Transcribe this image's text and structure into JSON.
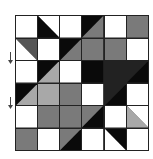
{
  "puzzle": {
    "rows": 6,
    "cols": 6,
    "colors": {
      "W": "#ffffff",
      "K": "#0a0a0a",
      "D": "#222222",
      "G": "#7a7a7a",
      "L": "#a8a8a8",
      "S": "#555555"
    },
    "cells": [
      [
        {
          "type": "solid",
          "a": "W"
        },
        {
          "type": "tr",
          "a": "W",
          "b": "K"
        },
        {
          "type": "solid",
          "a": "W"
        },
        {
          "type": "tl",
          "a": "K",
          "b": "G"
        },
        {
          "type": "solid",
          "a": "W"
        },
        {
          "type": "solid",
          "a": "G"
        }
      ],
      [
        {
          "type": "tr",
          "a": "S",
          "b": "W"
        },
        {
          "type": "solid",
          "a": "W"
        },
        {
          "type": "tl",
          "a": "K",
          "b": "G"
        },
        {
          "type": "solid",
          "a": "G"
        },
        {
          "type": "solid",
          "a": "G"
        },
        {
          "type": "solid",
          "a": "W"
        }
      ],
      [
        {
          "type": "solid",
          "a": "W"
        },
        {
          "type": "tl",
          "a": "K",
          "b": "L"
        },
        {
          "type": "solid",
          "a": "W"
        },
        {
          "type": "solid",
          "a": "K"
        },
        {
          "type": "solid",
          "a": "D"
        },
        {
          "type": "tl",
          "a": "D",
          "b": "K"
        }
      ],
      [
        {
          "type": "tl",
          "a": "K",
          "b": "L"
        },
        {
          "type": "solid",
          "a": "L"
        },
        {
          "type": "solid",
          "a": "G"
        },
        {
          "type": "solid",
          "a": "W"
        },
        {
          "type": "tl",
          "a": "D",
          "b": "K"
        },
        {
          "type": "solid",
          "a": "W"
        }
      ],
      [
        {
          "type": "solid",
          "a": "W"
        },
        {
          "type": "solid",
          "a": "G"
        },
        {
          "type": "solid",
          "a": "G"
        },
        {
          "type": "tl",
          "a": "G",
          "b": "K"
        },
        {
          "type": "solid",
          "a": "W"
        },
        {
          "type": "tr",
          "a": "W",
          "b": "L"
        }
      ],
      [
        {
          "type": "solid",
          "a": "G"
        },
        {
          "type": "solid",
          "a": "W"
        },
        {
          "type": "tl",
          "a": "G",
          "b": "K"
        },
        {
          "type": "solid",
          "a": "W"
        },
        {
          "type": "tr",
          "a": "K",
          "b": "W"
        },
        {
          "type": "solid",
          "a": "W"
        }
      ]
    ]
  },
  "markers": [
    {
      "name": "down-arrow-1",
      "top": 52
    },
    {
      "name": "down-arrow-2",
      "top": 97
    }
  ]
}
